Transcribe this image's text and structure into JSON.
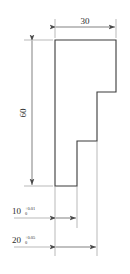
{
  "drawing": {
    "title": "Stepped profile part drawing",
    "background_color": "#ffffff",
    "outline_color": "#3a3a3a",
    "dimension_color": "#6e6e6e",
    "text_color": "#2b2b2b",
    "dimensions": {
      "width_top": {
        "label": "30",
        "value": 30,
        "orientation": "horizontal",
        "position": "top"
      },
      "height_left": {
        "label": "60",
        "value": 60,
        "orientation": "vertical",
        "position": "left"
      },
      "step_small": {
        "label": "10",
        "value": 10,
        "tolerance_upper": "+0.01",
        "tolerance_lower": "0",
        "orientation": "horizontal",
        "position": "bottom"
      },
      "step_large": {
        "label": "20",
        "value": 20,
        "tolerance_upper": "+0.05",
        "tolerance_lower": "0",
        "orientation": "horizontal",
        "position": "bottom"
      }
    },
    "profile": {
      "description": "Stepped staircase outline with three vertical risers on the right side",
      "vertices": "55,40 116,40 116,92 97,92 97,141 77,141 77,186 55,186"
    }
  }
}
